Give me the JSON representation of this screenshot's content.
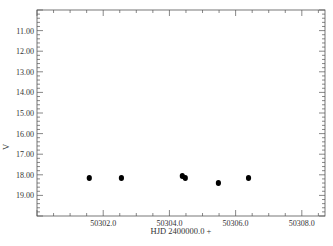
{
  "chart_data": {
    "type": "scatter",
    "title": "",
    "xlabel": "HJD 2400000.0 +",
    "ylabel": "V",
    "xlim": [
      50300.0,
      50308.7
    ],
    "ylim": [
      20.0,
      10.0
    ],
    "y_inverted": true,
    "grid": false,
    "legend": null,
    "x_ticks": [
      50302.0,
      50304.0,
      50306.0,
      50308.0
    ],
    "x_tick_labels": [
      "50302.0",
      "50304.0",
      "50306.0",
      "50308.0"
    ],
    "y_ticks": [
      11.0,
      12.0,
      13.0,
      14.0,
      15.0,
      16.0,
      17.0,
      18.0,
      19.0
    ],
    "y_tick_labels": [
      "11.00",
      "12.00",
      "13.00",
      "14.00",
      "15.00",
      "16.00",
      "17.00",
      "18.00",
      "19.00"
    ],
    "series": [
      {
        "name": "V",
        "marker": "filled-circle",
        "color": "#000000",
        "x": [
          50301.58,
          50302.55,
          50304.39,
          50304.48,
          50305.48,
          50306.39
        ],
        "y": [
          18.15,
          18.15,
          18.06,
          18.15,
          18.4,
          18.15
        ]
      }
    ]
  }
}
